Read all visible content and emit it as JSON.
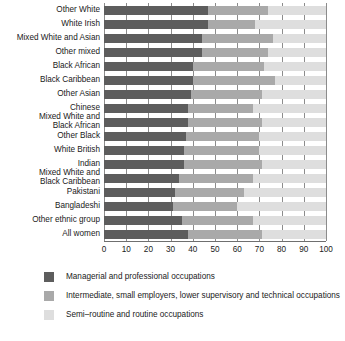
{
  "chart_data": {
    "type": "bar",
    "orientation": "horizontal",
    "stacked": true,
    "title": "",
    "xlabel": "",
    "ylabel": "",
    "xlim": [
      0,
      100
    ],
    "xticks": [
      0,
      10,
      20,
      30,
      40,
      50,
      60,
      70,
      80,
      90,
      100
    ],
    "grid": true,
    "legend_position": "bottom",
    "categories": [
      "Other White",
      "White Irish",
      "Mixed White and Asian",
      "Other mixed",
      "Black African",
      "Black Caribbean",
      "Other Asian",
      "Chinese",
      "Mixed White and\nBlack African",
      "Other Black",
      "White British",
      "Indian",
      "Mixed White and\nBlack Caribbean",
      "Pakistani",
      "Bangladeshi",
      "Other ethnic group",
      "All women"
    ],
    "series": [
      {
        "name": "Managerial and professional occupations",
        "color": "#5d5d5d",
        "values": [
          47,
          47,
          44,
          44,
          40,
          40,
          39,
          38,
          38,
          37,
          36,
          36,
          34,
          32,
          31,
          35,
          38
        ]
      },
      {
        "name": "Intermediate, small employers, lower supervisory and technical occupations",
        "color": "#a9a9a9",
        "values": [
          27,
          21,
          32,
          30,
          32,
          37,
          32,
          29,
          33,
          33,
          34,
          35,
          33,
          31,
          29,
          32,
          33
        ]
      },
      {
        "name": "Semi-routine and routine occupations",
        "color": "#dedede",
        "values": [
          26,
          32,
          24,
          26,
          28,
          23,
          29,
          33,
          29,
          30,
          30,
          29,
          33,
          37,
          40,
          33,
          29
        ]
      }
    ]
  },
  "legend": {
    "items": [
      {
        "label": "Managerial and professional occupations",
        "color": "#5d5d5d"
      },
      {
        "label": "Intermediate, small employers, lower supervisory and technical occupations",
        "color": "#a9a9a9"
      },
      {
        "label": "Semi–routine and routine occupations",
        "color": "#dedede"
      }
    ]
  }
}
